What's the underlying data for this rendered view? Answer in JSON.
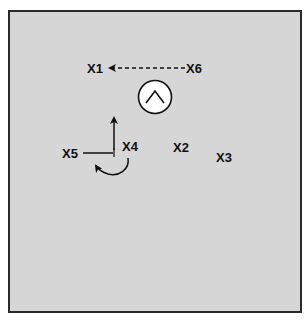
{
  "diagram": {
    "labels": {
      "x1": "X1",
      "x2": "X2",
      "x3": "X3",
      "x4": "X4",
      "x5": "X5",
      "x6": "X6"
    },
    "colors": {
      "background": "#d6d6d6",
      "border": "#2a2a2a",
      "ink": "#111111",
      "circle_fill": "#ffffff"
    },
    "icons": {
      "center_symbol": "caret-up-in-circle"
    }
  }
}
